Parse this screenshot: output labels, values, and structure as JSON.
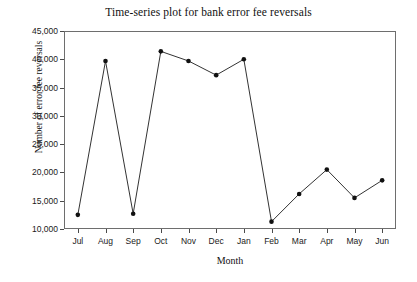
{
  "chart_data": {
    "type": "line",
    "title": "Time-series plot for bank error fee reversals",
    "xlabel": "Month",
    "ylabel": "Number of error fee reversals",
    "categories": [
      "Jul",
      "Aug",
      "Sep",
      "Oct",
      "Nov",
      "Dec",
      "Jan",
      "Feb",
      "Mar",
      "Apr",
      "May",
      "Jun"
    ],
    "values": [
      12500,
      39700,
      12700,
      41400,
      39700,
      37200,
      40000,
      11300,
      16200,
      20500,
      15500,
      18600
    ],
    "ylim": [
      10000,
      45000
    ],
    "ytick_values": [
      10000,
      15000,
      20000,
      25000,
      30000,
      35000,
      40000,
      45000
    ],
    "ytick_labels": [
      "10,000",
      "15,000",
      "20,000",
      "25,000",
      "30,000",
      "35,000",
      "40,000",
      "45,000"
    ],
    "grid": false,
    "legend": null,
    "marker": "filled-circle",
    "line_color": "#333333",
    "marker_color": "#111111",
    "frame_color": "#6e6e6e",
    "background": "#ffffff"
  }
}
